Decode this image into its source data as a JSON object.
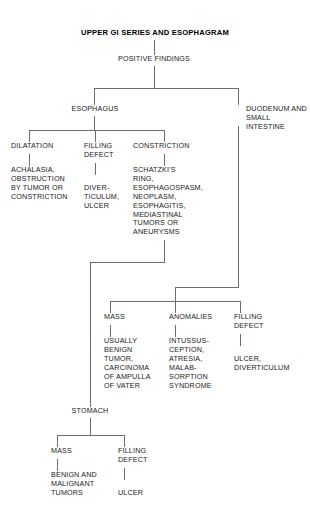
{
  "diagram": {
    "title": "UPPER GI SERIES AND ESOPHAGRAM",
    "root": "POSITIVE FINDINGS",
    "branches": {
      "esophagus": {
        "label": "ESOPHAGUS",
        "children": [
          {
            "label": "DILATATION",
            "detail": "ACHALASIA,\nOBSTRUCTION\nBY TUMOR OR\nCONSTRICTION"
          },
          {
            "label": "FILLING\nDEFECT",
            "detail": "DIVER-\nTICULUM,\nULCER"
          },
          {
            "label": "CONSTRICTION",
            "detail": "SCHATZKI'S\nRING,\nESOPHAGOSPASM,\nNEOPLASM,\nESOPHAGITIS,\nMEDIASTINAL\nTUMORS OR\nANEURYSMS"
          }
        ]
      },
      "duodenum": {
        "label": "DUODENUM AND\nSMALL INTESTINE",
        "children": [
          {
            "label": "MASS",
            "detail": "USUALLY\nBENIGN\nTUMOR,\nCARCINOMA\nOF AMPULLA\nOF VATER"
          },
          {
            "label": "ANOMALIES",
            "detail": "INTUSSUS-\nCEPTION,\nATRESIA,\nMALAB-\nSORPTION\nSYNDROME"
          },
          {
            "label": "FILLING\nDEFECT",
            "detail": "ULCER,\nDIVERTICULUM"
          }
        ]
      },
      "stomach": {
        "label": "STOMACH",
        "children": [
          {
            "label": "MASS",
            "detail": "BENIGN AND\nMALIGNANT\nTUMORS"
          },
          {
            "label": "FILLING\nDEFECT",
            "detail": "ULCER"
          }
        ]
      }
    },
    "colors": {
      "line": "#6e6e6e",
      "text": "#222222",
      "title": "#000000",
      "background": "#ffffff"
    }
  }
}
